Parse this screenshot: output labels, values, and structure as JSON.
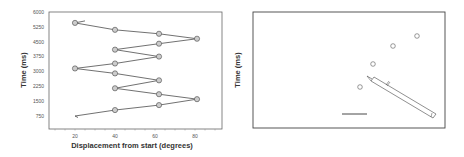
{
  "chart_data": [
    {
      "type": "line",
      "panel": "left",
      "title": "",
      "xlabel": "Displacement from start (degrees)",
      "ylabel": "Time (ms)",
      "xlim": [
        8,
        95
      ],
      "ylim": [
        0,
        6000
      ],
      "xticks": [
        "20",
        "40",
        "60",
        "80"
      ],
      "yticks": [
        "6000",
        "5250",
        "4500",
        "3750",
        "3000",
        "2250",
        "1500",
        "750"
      ],
      "markers": "circle",
      "marker_color": "#cccccc",
      "series": [
        {
          "name": "trajectory",
          "points": [
            {
              "x": 20,
              "y": 5450
            },
            {
              "x": 40,
              "y": 5100
            },
            {
              "x": 62,
              "y": 4900
            },
            {
              "x": 81,
              "y": 4650
            },
            {
              "x": 62,
              "y": 4400
            },
            {
              "x": 40,
              "y": 4100
            },
            {
              "x": 62,
              "y": 3750
            },
            {
              "x": 40,
              "y": 3400
            },
            {
              "x": 20,
              "y": 3150
            },
            {
              "x": 40,
              "y": 2900
            },
            {
              "x": 62,
              "y": 2550
            },
            {
              "x": 40,
              "y": 2150
            },
            {
              "x": 62,
              "y": 1850
            },
            {
              "x": 81,
              "y": 1600
            },
            {
              "x": 62,
              "y": 1300
            },
            {
              "x": 40,
              "y": 1050
            },
            {
              "x": 20,
              "y": 750,
              "marker": false
            }
          ]
        }
      ]
    },
    {
      "type": "diagram",
      "panel": "right",
      "ylabel": "Time (ms)",
      "xlabel": "",
      "elements": [
        "four open circles along a diagonal",
        "pen/stylus drawing",
        "horizontal scale bar"
      ]
    }
  ]
}
